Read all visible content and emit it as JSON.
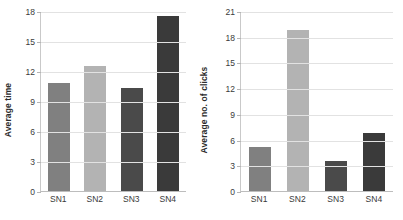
{
  "chart_data": [
    {
      "type": "bar",
      "title": "",
      "xlabel": "",
      "ylabel": "Average time",
      "categories": [
        "SN1",
        "SN2",
        "SN3",
        "SN4"
      ],
      "values": [
        10.8,
        12.5,
        10.3,
        17.5
      ],
      "ylim": [
        0,
        18
      ],
      "yticks": [
        0,
        3,
        6,
        9,
        12,
        15,
        18
      ],
      "ytick_labels": [
        "0",
        "3",
        "6",
        "9",
        "12",
        "15",
        "18"
      ],
      "grid": true,
      "legend": "none",
      "bar_colors": [
        "#808080",
        "#b3b3b3",
        "#4a4a4a",
        "#3a3a3a"
      ]
    },
    {
      "type": "bar",
      "title": "",
      "xlabel": "",
      "ylabel": "Average no. of clicks",
      "categories": [
        "SN1",
        "SN2",
        "SN3",
        "SN4"
      ],
      "values": [
        5.1,
        18.8,
        3.5,
        6.8
      ],
      "ylim": [
        0,
        21
      ],
      "yticks": [
        0,
        3,
        6,
        9,
        12,
        15,
        18,
        21
      ],
      "ytick_labels": [
        "0",
        "3",
        "6",
        "9",
        "12",
        "15",
        "18",
        "21"
      ],
      "grid": true,
      "legend": "none",
      "bar_colors": [
        "#808080",
        "#b3b3b3",
        "#4a4a4a",
        "#3a3a3a"
      ]
    }
  ]
}
